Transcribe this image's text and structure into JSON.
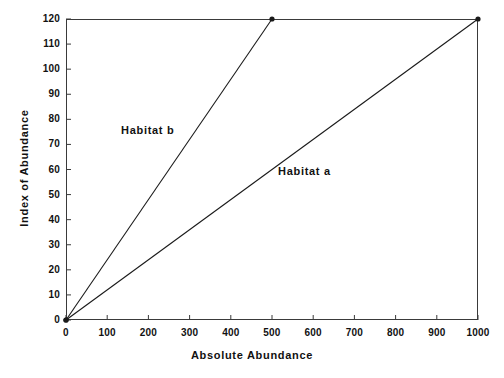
{
  "chart_data": {
    "type": "line",
    "title": "",
    "subtitle": "",
    "xlabel": "Absolute Abundance",
    "ylabel": "Index of Abundance",
    "xlim": [
      0,
      1000
    ],
    "ylim": [
      0,
      120
    ],
    "xticks": [
      0,
      100,
      200,
      300,
      400,
      500,
      600,
      700,
      800,
      900,
      1000
    ],
    "yticks": [
      0,
      10,
      20,
      30,
      40,
      50,
      60,
      70,
      80,
      90,
      100,
      110,
      120
    ],
    "grid": false,
    "legend_position": "inline-annotation",
    "frame": "box",
    "line_color": "#1a1a1a",
    "background_color": "#ffffff",
    "series": [
      {
        "name": "Habitat a",
        "label": "Habitat a",
        "marker": "filled-circle",
        "x": [
          0,
          1000
        ],
        "y": [
          0,
          120
        ],
        "slope_per_unit": 0.12,
        "annotation": {
          "text": "Habitat a",
          "x": 515,
          "y": 57
        }
      },
      {
        "name": "Habitat b",
        "label": "Habitat b",
        "marker": "filled-circle",
        "x": [
          0,
          500
        ],
        "y": [
          0,
          120
        ],
        "slope_per_unit": 0.24,
        "annotation": {
          "text": "Habitat b",
          "x": 135,
          "y": 79
        }
      }
    ]
  },
  "axes": {
    "x_title": "Absolute Abundance",
    "y_title": "Index of Abundance",
    "x_tick_labels": [
      "0",
      "100",
      "200",
      "300",
      "400",
      "500",
      "600",
      "700",
      "800",
      "900",
      "1000"
    ],
    "y_tick_labels": [
      "0",
      "10",
      "20",
      "30",
      "40",
      "50",
      "60",
      "70",
      "80",
      "90",
      "100",
      "110",
      "120"
    ]
  },
  "annotations": {
    "habitat_a": "Habitat a",
    "habitat_b": "Habitat b"
  }
}
